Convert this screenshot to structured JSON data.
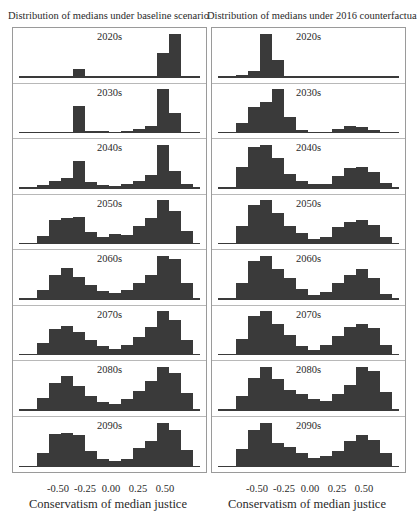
{
  "chart_data": [
    {
      "type": "bar",
      "title": "Distribution of medians under baseline scenario",
      "xlabel": "Conservatism of median justice",
      "ylabel": "",
      "x_ticks": [
        "-0.50",
        "-0.25",
        "0.00",
        "0.25",
        "0.50"
      ],
      "x_tick_values": [
        -0.5,
        -0.25,
        0.0,
        0.25,
        0.5
      ],
      "bin_centers": [
        -0.72,
        -0.61,
        -0.5,
        -0.39,
        -0.28,
        -0.17,
        -0.06,
        0.06,
        0.17,
        0.28,
        0.39,
        0.5,
        0.61,
        0.72
      ],
      "xlim": [
        -0.8,
        0.8
      ],
      "grid": false,
      "panels": [
        {
          "label": "2020s",
          "values": [
            0,
            0,
            0,
            0,
            20,
            2,
            1,
            0,
            0,
            0,
            0,
            55,
            100,
            0
          ]
        },
        {
          "label": "2030s",
          "values": [
            0,
            0,
            1,
            2,
            62,
            4,
            4,
            1,
            4,
            8,
            15,
            100,
            46,
            2
          ]
        },
        {
          "label": "2040s",
          "values": [
            1,
            8,
            18,
            23,
            62,
            14,
            7,
            6,
            10,
            18,
            30,
            100,
            40,
            11
          ]
        },
        {
          "label": "2050s",
          "values": [
            2,
            18,
            55,
            58,
            62,
            28,
            17,
            22,
            20,
            40,
            58,
            100,
            75,
            30
          ]
        },
        {
          "label": "2060s",
          "values": [
            2,
            22,
            55,
            72,
            52,
            33,
            20,
            15,
            22,
            38,
            55,
            100,
            92,
            37
          ]
        },
        {
          "label": "2070s",
          "values": [
            2,
            28,
            58,
            66,
            53,
            34,
            21,
            13,
            23,
            42,
            63,
            100,
            80,
            33
          ]
        },
        {
          "label": "2080s",
          "values": [
            2,
            28,
            62,
            78,
            56,
            34,
            20,
            14,
            26,
            45,
            68,
            100,
            86,
            39
          ]
        },
        {
          "label": "2090s",
          "values": [
            2,
            31,
            75,
            78,
            72,
            37,
            18,
            14,
            19,
            44,
            58,
            100,
            84,
            38
          ]
        }
      ]
    },
    {
      "type": "bar",
      "title": "Distribution of medians under 2016 counterfactual",
      "xlabel": "Conservatism of median justice",
      "ylabel": "",
      "x_ticks": [
        "-0.50",
        "-0.25",
        "0.00",
        "0.25",
        "0.50"
      ],
      "x_tick_values": [
        -0.5,
        -0.25,
        0.0,
        0.25,
        0.5
      ],
      "bin_centers": [
        -0.72,
        -0.61,
        -0.5,
        -0.39,
        -0.28,
        -0.17,
        -0.06,
        0.06,
        0.17,
        0.28,
        0.39,
        0.5,
        0.61,
        0.72
      ],
      "xlim": [
        -0.8,
        0.8
      ],
      "grid": false,
      "panels": [
        {
          "label": "2020s",
          "values": [
            2,
            5,
            15,
            100,
            40,
            4,
            1,
            1,
            2,
            2,
            2,
            3,
            1,
            0
          ]
        },
        {
          "label": "2030s",
          "values": [
            2,
            22,
            60,
            70,
            100,
            37,
            7,
            3,
            3,
            10,
            16,
            14,
            7,
            2
          ]
        },
        {
          "label": "2040s",
          "values": [
            3,
            48,
            95,
            100,
            70,
            34,
            16,
            10,
            10,
            28,
            46,
            50,
            38,
            13
          ]
        },
        {
          "label": "2050s",
          "values": [
            3,
            42,
            88,
            100,
            70,
            42,
            24,
            12,
            17,
            38,
            50,
            55,
            43,
            17
          ]
        },
        {
          "label": "2060s",
          "values": [
            3,
            38,
            88,
            100,
            70,
            50,
            24,
            10,
            18,
            38,
            55,
            70,
            50,
            13
          ]
        },
        {
          "label": "2070s",
          "values": [
            3,
            36,
            88,
            100,
            70,
            46,
            21,
            12,
            23,
            43,
            63,
            71,
            62,
            22
          ]
        },
        {
          "label": "2080s",
          "values": [
            3,
            33,
            75,
            100,
            72,
            47,
            38,
            27,
            21,
            37,
            58,
            100,
            90,
            41
          ]
        },
        {
          "label": "2090s",
          "values": [
            3,
            40,
            83,
            100,
            55,
            45,
            32,
            21,
            25,
            36,
            59,
            72,
            61,
            32
          ]
        }
      ]
    }
  ],
  "figure": {
    "bar_color": "#3a3a3a",
    "left_title": "Distribution of medians under baseline scenario",
    "right_title": "Distribution of medians under 2016 counterfactual",
    "xlabel": "Conservatism of median justice",
    "ticks": [
      "-0.50",
      "-0.25",
      "0.00",
      "0.25",
      "0.50"
    ]
  }
}
